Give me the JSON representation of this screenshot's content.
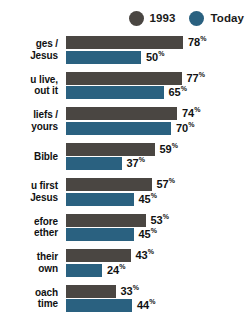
{
  "legend": {
    "items": [
      {
        "label": "1993",
        "color": "#4a4642",
        "icon": "circle-swatch-icon"
      },
      {
        "label": "Today",
        "color": "#2a6180",
        "icon": "circle-swatch-icon"
      }
    ]
  },
  "chart_data": {
    "type": "bar",
    "title": "",
    "xlabel": "",
    "ylabel": "",
    "xlim": [
      0,
      100
    ],
    "grid": false,
    "orientation": "horizontal",
    "legend_position": "top-right",
    "value_suffix": "%",
    "categories": [
      "ges /\nJesus",
      "u live,\nout it",
      "liefs /\nyours",
      "Bible",
      "u first\nJesus",
      "efore\nether",
      "their\nown",
      "oach\ntime"
    ],
    "category_lines": [
      [
        "ges /",
        "Jesus"
      ],
      [
        "u live,",
        "out it"
      ],
      [
        "liefs /",
        "yours"
      ],
      [
        "Bible"
      ],
      [
        "u first",
        "Jesus"
      ],
      [
        "efore",
        "ether"
      ],
      [
        "their",
        "own"
      ],
      [
        "oach",
        "time"
      ]
    ],
    "series": [
      {
        "name": "1993",
        "color": "#4a4642",
        "values": [
          78,
          77,
          74,
          59,
          57,
          53,
          43,
          33
        ]
      },
      {
        "name": "Today",
        "color": "#2a6180",
        "values": [
          50,
          65,
          70,
          37,
          45,
          45,
          24,
          44
        ]
      }
    ],
    "labels": {
      "1993": [
        "78",
        "77",
        "74",
        "59",
        "57",
        "53",
        "43",
        "33"
      ],
      "Today": [
        "50",
        "65",
        "70",
        "37",
        "45",
        "45",
        "24",
        "44"
      ]
    }
  }
}
